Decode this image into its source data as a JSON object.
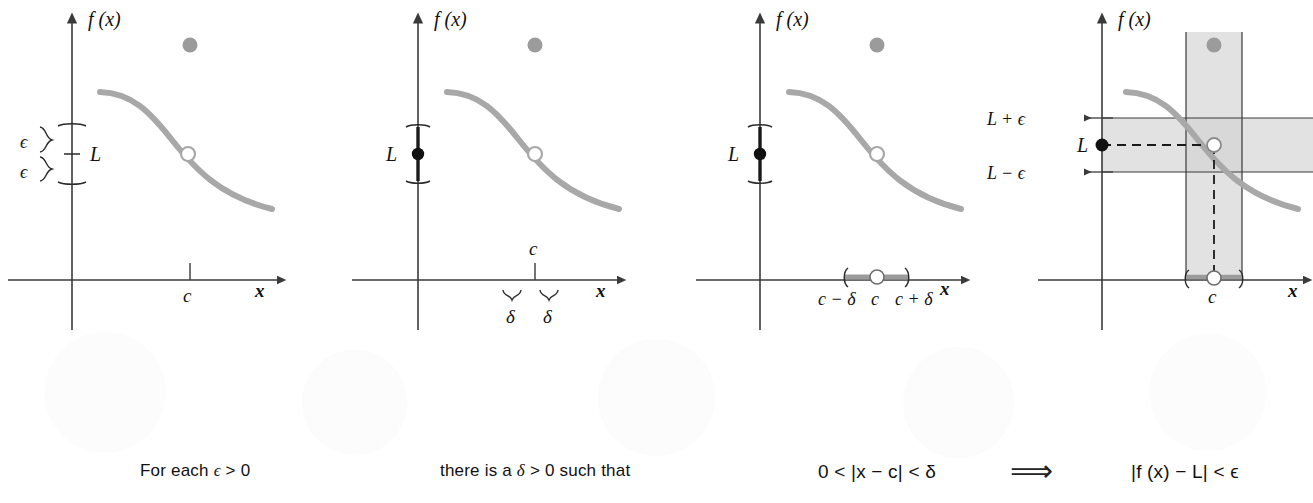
{
  "figure": {
    "background_color": "#ffffff",
    "curve_color": "#a8a8a8",
    "axis_color": "#3a3a3a",
    "band_fill": "#e2e2e2",
    "ink_color": "#1a1a1a",
    "ghost_dot_color": "#9b9b9b"
  },
  "panels": [
    {
      "id": "panel-1",
      "caption_key": "for_each_epsilon",
      "y_axis_label": "f (x)",
      "x_axis_label": "x",
      "labels": {
        "limit": "L",
        "epsilon_upper": "ϵ",
        "epsilon_lower": "ϵ",
        "c_tick": "c"
      }
    },
    {
      "id": "panel-2",
      "caption_key": "there_is_a_delta",
      "y_axis_label": "f (x)",
      "x_axis_label": "x",
      "labels": {
        "limit": "L",
        "c_tick": "c",
        "delta_left": "δ",
        "delta_right": "δ"
      }
    },
    {
      "id": "panel-3",
      "caption_key": "inequality_x",
      "y_axis_label": "f (x)",
      "x_axis_label": "x",
      "labels": {
        "limit": "L",
        "c_minus_delta": "c − δ",
        "c": "c",
        "c_plus_delta": "c + δ"
      }
    },
    {
      "id": "panel-4",
      "caption_key": "inequality_f",
      "y_axis_label": "f (x)",
      "x_axis_label": "x",
      "labels": {
        "limit": "L",
        "l_plus_epsilon": "L + ϵ",
        "l_minus_epsilon": "L − ϵ",
        "c_tick": "c"
      }
    }
  ],
  "caption": {
    "for_each_epsilon_plain": "For each ",
    "for_each_epsilon_sym": "ϵ",
    "for_each_epsilon_tail": " > 0",
    "there_is_a_plain": "there is a  ",
    "there_is_a_sym": "δ",
    "there_is_a_tail": " > 0 such that",
    "inequality_x": "0 < |x − c| < δ",
    "implies_arrow": "⟹",
    "inequality_f": "|f (x) − L| < ϵ"
  }
}
